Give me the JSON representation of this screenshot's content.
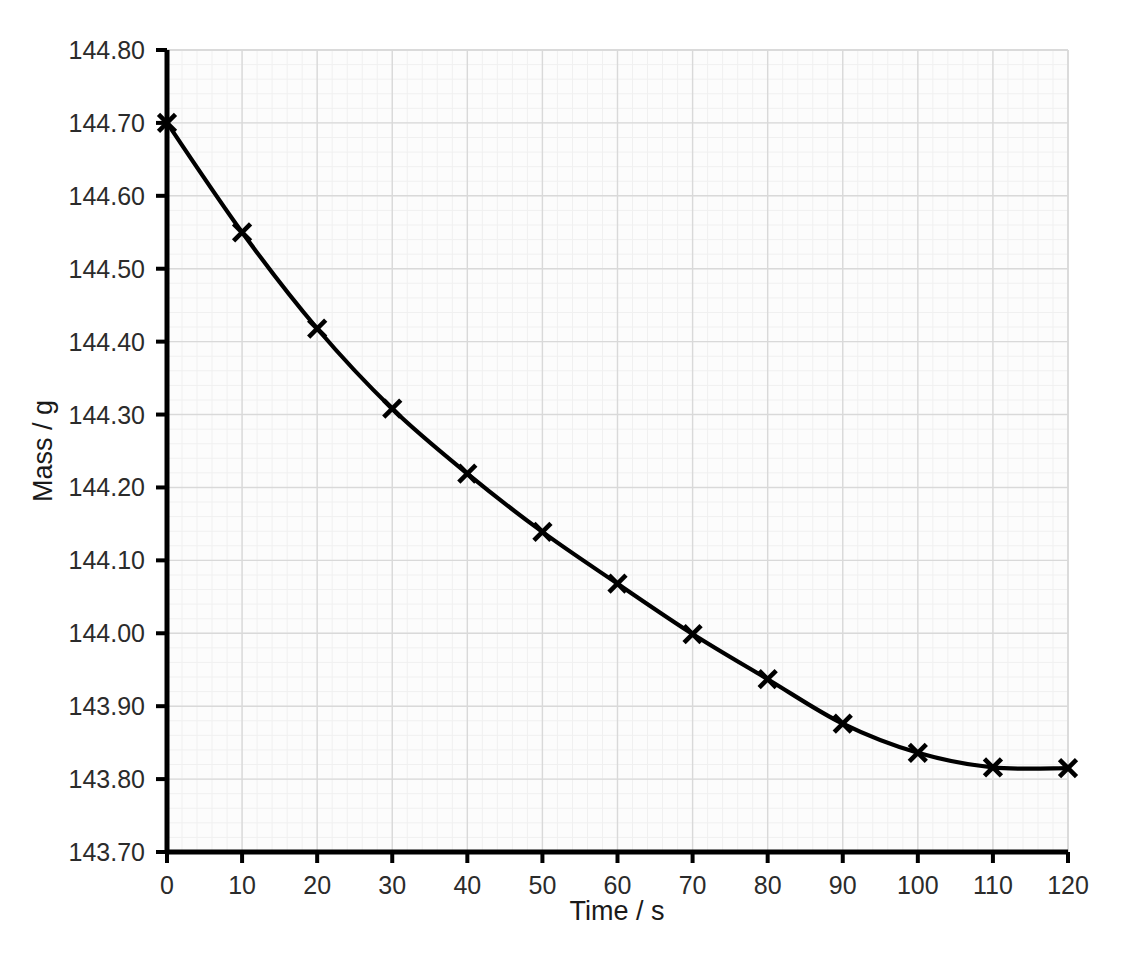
{
  "chart_data": {
    "type": "line",
    "title": "",
    "xlabel": "Time / s",
    "ylabel": "Mass / g",
    "x": [
      0,
      10,
      20,
      30,
      40,
      50,
      60,
      70,
      80,
      90,
      100,
      110,
      120
    ],
    "values": [
      144.7,
      144.55,
      144.418,
      144.308,
      144.219,
      144.139,
      144.068,
      143.999,
      143.937,
      143.876,
      143.836,
      143.816,
      143.815
    ],
    "series": [
      {
        "name": "Mass",
        "values": [
          144.7,
          144.55,
          144.418,
          144.308,
          144.219,
          144.139,
          144.068,
          143.999,
          143.937,
          143.876,
          143.836,
          143.816,
          143.815
        ]
      }
    ],
    "xlim": [
      0,
      120
    ],
    "ylim": [
      143.7,
      144.8
    ],
    "xticks": [
      0,
      10,
      20,
      30,
      40,
      50,
      60,
      70,
      80,
      90,
      100,
      110,
      120
    ],
    "yticks": [
      143.7,
      143.8,
      143.9,
      144.0,
      144.1,
      144.2,
      144.3,
      144.4,
      144.5,
      144.6,
      144.7,
      144.8
    ],
    "xtick_labels": [
      "0",
      "10",
      "20",
      "30",
      "40",
      "50",
      "60",
      "70",
      "80",
      "90",
      "100",
      "110",
      "120"
    ],
    "ytick_labels": [
      "143.70",
      "143.80",
      "143.90",
      "144.00",
      "144.10",
      "144.20",
      "144.30",
      "144.40",
      "144.50",
      "144.60",
      "144.70",
      "144.80"
    ],
    "grid": true,
    "grid_minor": true,
    "legend": "none",
    "marker": "x-cross",
    "line_color": "#000000",
    "marker_color": "#000000",
    "grid_color": "#d9d9d9",
    "grid_minor_color": "#f0f0f0",
    "plot_background": "#fcfcfc",
    "axis_color": "#000000"
  }
}
